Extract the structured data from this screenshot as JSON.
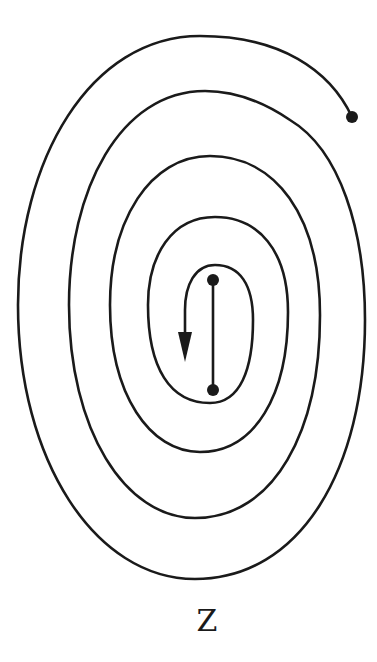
{
  "figure": {
    "label": "Z",
    "stroke_color": "#1a1a1a",
    "background": "#ffffff"
  }
}
